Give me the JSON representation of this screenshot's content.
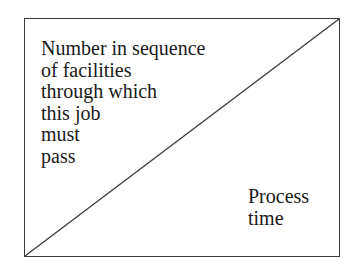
{
  "diagram": {
    "top_left_label": [
      "Number in sequence",
      "of facilities",
      "through which",
      "this job",
      "must",
      "pass"
    ],
    "bottom_right_label": [
      "Process",
      "time"
    ],
    "colors": {
      "line": "#3a3a3a",
      "text": "#1a1a1a",
      "background": "#ffffff"
    }
  }
}
